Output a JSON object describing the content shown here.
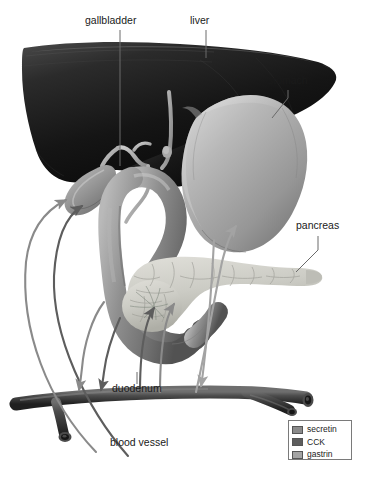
{
  "figure": {
    "background_color": "#ffffff"
  },
  "labels": [
    {
      "id": "gallbladder",
      "text": "gallbladder",
      "x": 85,
      "y": 24
    },
    {
      "id": "liver",
      "text": "liver",
      "x": 190,
      "y": 24
    },
    {
      "id": "stomach",
      "text": "stomach",
      "x": 268,
      "y": 84
    },
    {
      "id": "pancreas",
      "text": "pancreas",
      "x": 296,
      "y": 229
    },
    {
      "id": "duodenum",
      "text": "duodenum",
      "x": 112,
      "y": 392
    },
    {
      "id": "blood_vessel",
      "text": "blood vessel",
      "x": 110,
      "y": 446
    }
  ],
  "legend": {
    "items": [
      {
        "label": "secretin",
        "color": "#8a8a8a"
      },
      {
        "label": "CCK",
        "color": "#5d5d5d"
      },
      {
        "label": "gastrin",
        "color": "#a3a3a3"
      }
    ]
  },
  "organs": [
    {
      "id": "liver",
      "name": "liver",
      "color": "#1d1d1d"
    },
    {
      "id": "gallbladder",
      "name": "gallbladder",
      "color": "#9a9a9a"
    },
    {
      "id": "stomach",
      "name": "stomach",
      "color": "#a8a8a8"
    },
    {
      "id": "pancreas",
      "name": "pancreas",
      "color": "#c9c9c4"
    },
    {
      "id": "duodenum",
      "name": "duodenum",
      "color": "#8e8e8e"
    },
    {
      "id": "blood_vessel",
      "name": "blood vessel",
      "color": "#4a4a4a"
    }
  ],
  "arrows": [
    {
      "id": "secretin-to-gallbladder",
      "hormone": "secretin",
      "from": "duodenum",
      "to": "gallbladder",
      "direction": "up-left"
    },
    {
      "id": "cck-to-gallbladder",
      "hormone": "CCK",
      "from": "duodenum",
      "to": "gallbladder",
      "direction": "up-left"
    },
    {
      "id": "secretin-to-vessel",
      "hormone": "secretin",
      "from": "duodenum",
      "to": "blood vessel",
      "direction": "down-left"
    },
    {
      "id": "cck-to-vessel",
      "hormone": "CCK",
      "from": "duodenum",
      "to": "blood vessel",
      "direction": "down-left"
    },
    {
      "id": "gastrin-to-stomach",
      "hormone": "gastrin",
      "from": "blood vessel",
      "to": "stomach",
      "direction": "up-right"
    },
    {
      "id": "secretin-to-pancreas",
      "hormone": "secretin",
      "from": "blood vessel",
      "to": "pancreas",
      "direction": "up-right"
    },
    {
      "id": "cck-to-pancreas",
      "hormone": "CCK",
      "from": "blood vessel",
      "to": "pancreas",
      "direction": "up-right"
    },
    {
      "id": "stomach-to-vessel",
      "hormone": "gastrin",
      "from": "stomach",
      "to": "blood vessel",
      "direction": "down"
    }
  ]
}
